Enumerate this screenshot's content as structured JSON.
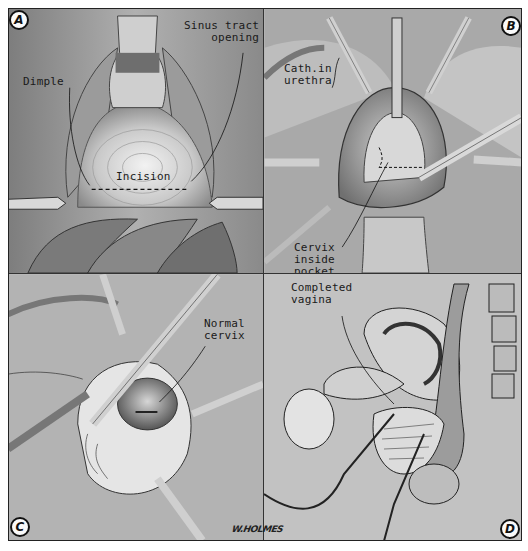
{
  "figure": {
    "style": "black-and-white surgical illustration, four panels",
    "artist_signature": "W.HOLMES"
  },
  "panels": [
    {
      "id": "A",
      "badge": "A",
      "labels": [
        {
          "text": "Dimple"
        },
        {
          "text": "Sinus tract\nopening"
        },
        {
          "text": "Incision"
        }
      ]
    },
    {
      "id": "B",
      "badge": "B",
      "labels": [
        {
          "text": "Cath.in\nurethra"
        },
        {
          "text": "Cervix\ninside\npocket"
        }
      ]
    },
    {
      "id": "C",
      "badge": "C",
      "labels": [
        {
          "text": "Normal\ncervix"
        }
      ]
    },
    {
      "id": "D",
      "badge": "D",
      "labels": [
        {
          "text": "Completed\nvagina"
        }
      ]
    }
  ],
  "colors": {
    "background": "#ffffff",
    "ink": "#1a1a1a",
    "tissue_light": "#e6e6e6",
    "tissue_mid": "#a8a8a8",
    "tissue_dark": "#555555"
  }
}
